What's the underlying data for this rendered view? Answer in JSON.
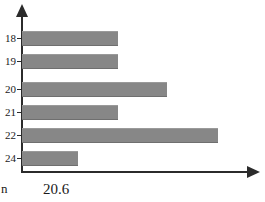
{
  "caption": {
    "left_text": "n",
    "value_text": "20.6"
  },
  "axes": {
    "y_arrow": "arrow-up-icon",
    "x_arrow": "arrow-right-icon"
  },
  "chart_data": {
    "type": "bar",
    "orientation": "horizontal",
    "title": "",
    "xlabel": "",
    "ylabel": "",
    "grid": false,
    "legend": false,
    "bar_color": "#878787",
    "axis_color": "#2b2b2b",
    "background": "#ffffff",
    "categories": [
      "18",
      "19",
      "20",
      "21",
      "22",
      "24"
    ],
    "values": [
      96,
      96,
      145,
      96,
      196,
      56
    ],
    "value_unit": "px-length-from-axis",
    "xlim": [
      0,
      230
    ],
    "bars": [
      {
        "label": "18",
        "length": 96,
        "top": 31
      },
      {
        "label": "19",
        "length": 96,
        "top": 54
      },
      {
        "label": "20",
        "length": 145,
        "top": 82
      },
      {
        "label": "21",
        "length": 96,
        "top": 105
      },
      {
        "label": "22",
        "length": 196,
        "top": 128
      },
      {
        "label": "24",
        "length": 56,
        "top": 151
      }
    ]
  }
}
